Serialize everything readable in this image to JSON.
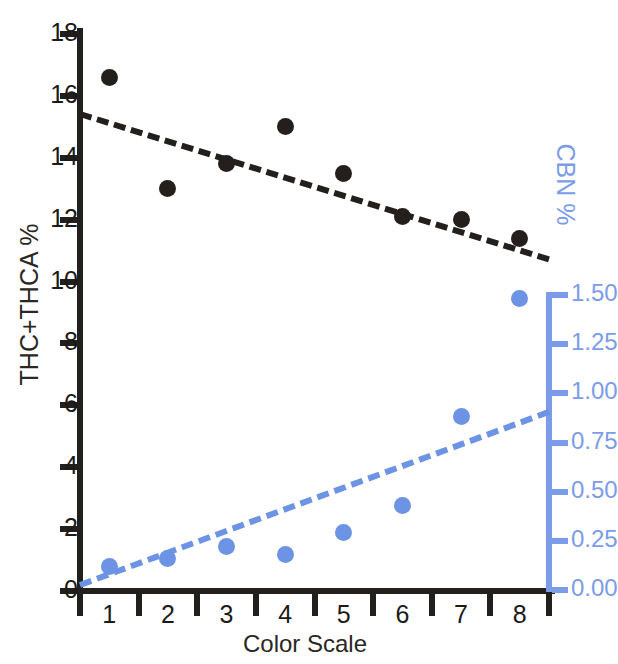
{
  "chart_data": {
    "type": "scatter",
    "title": "",
    "xlabel": "Color Scale",
    "ylabel": "THC+THCA %",
    "y2label": "CBN %",
    "categories": [
      "1",
      "2",
      "3",
      "4",
      "5",
      "6",
      "7",
      "8"
    ],
    "x": [
      1,
      2,
      3,
      4,
      5,
      6,
      7,
      8
    ],
    "xlim": [
      0.5,
      8.5
    ],
    "ylim": [
      0,
      18
    ],
    "y2lim": [
      0.0,
      1.5
    ],
    "grid": false,
    "legend": "none",
    "y_ticks": [
      0,
      2,
      4,
      6,
      8,
      10,
      12,
      14,
      16,
      18
    ],
    "y_tick_labels": [
      "0",
      "2",
      "4",
      "6",
      "8",
      "10",
      "12",
      "14",
      "16",
      "18"
    ],
    "y2_ticks": [
      0.0,
      0.25,
      0.5,
      0.75,
      1.0,
      1.25,
      1.5
    ],
    "y2_tick_labels": [
      "0.00",
      "0.25",
      "0.50",
      "0.75",
      "1.00",
      "1.25",
      "1.50"
    ],
    "x_tick_labels": [
      "1",
      "2",
      "3",
      "4",
      "5",
      "6",
      "7",
      "8"
    ],
    "series": [
      {
        "name": "THC+THCA %",
        "axis": "left",
        "color": "#241f1d",
        "marker": "circle",
        "values": [
          16.6,
          13.0,
          13.8,
          15.0,
          13.5,
          12.1,
          12.0,
          11.4
        ],
        "trendline": {
          "style": "dashed",
          "color": "#231f1d",
          "x_start": 0.5,
          "y_start": 15.5,
          "x_end": 8.5,
          "y_end": 10.8
        }
      },
      {
        "name": "CBN %",
        "axis": "right",
        "color": "#6d93e4",
        "marker": "circle",
        "values": [
          0.12,
          0.16,
          0.22,
          0.18,
          0.29,
          0.43,
          0.88,
          1.48
        ],
        "trendline": {
          "style": "dashed",
          "color": "#6d93e4",
          "x_start": 0.5,
          "y_start": 0.04,
          "x_end": 8.5,
          "y_end": 0.92
        }
      }
    ]
  }
}
